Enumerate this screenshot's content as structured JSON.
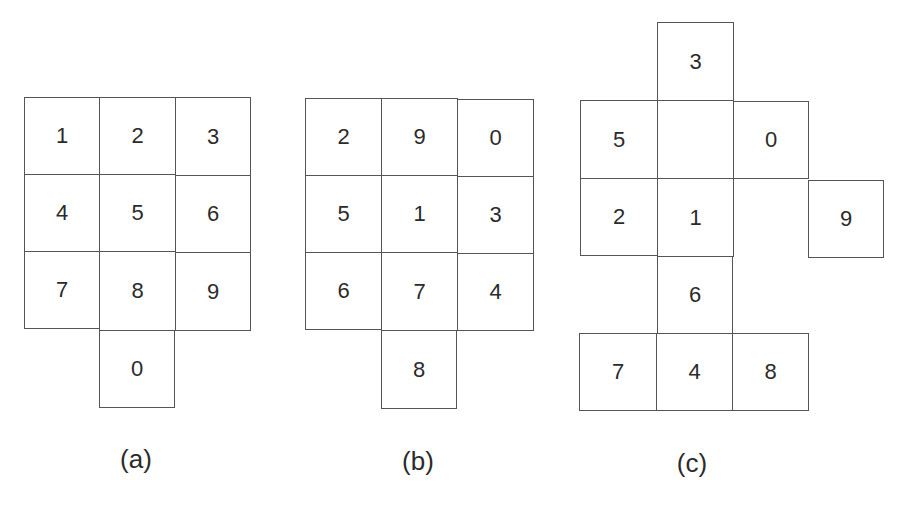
{
  "figure": {
    "panels": [
      {
        "id": "a",
        "caption": "(a)",
        "caption_pos": {
          "x": 136,
          "y": 444
        },
        "keys": [
          {
            "label": "1",
            "x": 24,
            "y": 97,
            "w": 76,
            "h": 78
          },
          {
            "label": "2",
            "x": 99,
            "y": 97,
            "w": 77,
            "h": 78
          },
          {
            "label": "3",
            "x": 175,
            "y": 97,
            "w": 76,
            "h": 79
          },
          {
            "label": "4",
            "x": 24,
            "y": 174,
            "w": 76,
            "h": 78
          },
          {
            "label": "5",
            "x": 99,
            "y": 174,
            "w": 77,
            "h": 78
          },
          {
            "label": "6",
            "x": 175,
            "y": 175,
            "w": 76,
            "h": 78
          },
          {
            "label": "7",
            "x": 24,
            "y": 251,
            "w": 76,
            "h": 78
          },
          {
            "label": "8",
            "x": 99,
            "y": 251,
            "w": 77,
            "h": 80
          },
          {
            "label": "9",
            "x": 175,
            "y": 252,
            "w": 76,
            "h": 79
          },
          {
            "label": "0",
            "x": 99,
            "y": 330,
            "w": 76,
            "h": 78
          }
        ]
      },
      {
        "id": "b",
        "caption": "(b)",
        "caption_pos": {
          "x": 418,
          "y": 446
        },
        "keys": [
          {
            "label": "2",
            "x": 305,
            "y": 98,
            "w": 77,
            "h": 78
          },
          {
            "label": "9",
            "x": 381,
            "y": 98,
            "w": 77,
            "h": 78
          },
          {
            "label": "0",
            "x": 457,
            "y": 99,
            "w": 77,
            "h": 78
          },
          {
            "label": "5",
            "x": 305,
            "y": 175,
            "w": 77,
            "h": 78
          },
          {
            "label": "1",
            "x": 381,
            "y": 175,
            "w": 77,
            "h": 78
          },
          {
            "label": "3",
            "x": 457,
            "y": 176,
            "w": 77,
            "h": 78
          },
          {
            "label": "6",
            "x": 305,
            "y": 252,
            "w": 77,
            "h": 78
          },
          {
            "label": "7",
            "x": 381,
            "y": 252,
            "w": 77,
            "h": 79
          },
          {
            "label": "4",
            "x": 457,
            "y": 253,
            "w": 77,
            "h": 78
          },
          {
            "label": "8",
            "x": 381,
            "y": 330,
            "w": 76,
            "h": 79
          }
        ]
      },
      {
        "id": "c",
        "caption": "(c)",
        "caption_pos": {
          "x": 692,
          "y": 448
        },
        "keys": [
          {
            "label": "3",
            "x": 657,
            "y": 22,
            "w": 77,
            "h": 79
          },
          {
            "label": "5",
            "x": 580,
            "y": 100,
            "w": 78,
            "h": 79
          },
          {
            "label": "",
            "x": 657,
            "y": 100,
            "w": 77,
            "h": 79
          },
          {
            "label": "0",
            "x": 733,
            "y": 101,
            "w": 76,
            "h": 78
          },
          {
            "label": "2",
            "x": 580,
            "y": 178,
            "w": 78,
            "h": 78
          },
          {
            "label": "1",
            "x": 657,
            "y": 178,
            "w": 77,
            "h": 79
          },
          {
            "label": "9",
            "x": 808,
            "y": 180,
            "w": 76,
            "h": 78
          },
          {
            "label": "6",
            "x": 657,
            "y": 256,
            "w": 76,
            "h": 78
          },
          {
            "label": "7",
            "x": 579,
            "y": 333,
            "w": 78,
            "h": 78
          },
          {
            "label": "4",
            "x": 656,
            "y": 333,
            "w": 77,
            "h": 78
          },
          {
            "label": "8",
            "x": 732,
            "y": 333,
            "w": 77,
            "h": 78
          }
        ]
      }
    ]
  }
}
